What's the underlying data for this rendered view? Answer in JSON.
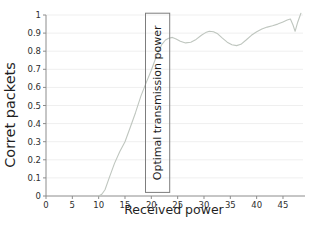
{
  "chart_data": {
    "type": "line",
    "title": "",
    "xlabel": "Received power",
    "ylabel": "Corret packets",
    "xlim": [
      0,
      48.8
    ],
    "ylim": [
      0,
      1
    ],
    "grid": "horizontal",
    "legend": "none",
    "xtick_values": [
      0,
      5,
      10,
      15,
      20,
      25,
      30,
      35,
      40,
      45
    ],
    "xtick_labels": [
      "0",
      "5",
      "10",
      "15",
      "20",
      "25",
      "30",
      "35",
      "40",
      "45"
    ],
    "ytick_values": [
      0,
      0.1,
      0.2,
      0.3,
      0.4,
      0.5,
      0.6,
      0.7,
      0.8,
      0.9,
      1
    ],
    "ytick_labels": [
      "0",
      "0.1",
      "0.2",
      "0.3",
      "0.4",
      "0.5",
      "0.6",
      "0.7",
      "0.8",
      "0.9",
      "1"
    ],
    "series": [
      {
        "name": "correct-packet-ratio",
        "x": [
          10,
          10.6,
          11.2,
          12,
          13,
          14,
          15,
          16,
          17,
          18,
          19,
          20,
          21,
          22,
          22.7,
          23.3,
          24,
          24.7,
          25.5,
          26.5,
          27.5,
          28.5,
          29.5,
          30.3,
          31,
          31.8,
          32.6,
          33.5,
          34.4,
          35.3,
          36.2,
          37,
          38,
          39,
          40,
          41,
          42,
          43,
          44,
          45,
          45.8,
          46.4,
          46.9,
          47.3,
          47.8,
          48.4
        ],
        "y": [
          0,
          0.01,
          0.035,
          0.1,
          0.18,
          0.245,
          0.3,
          0.38,
          0.46,
          0.55,
          0.625,
          0.695,
          0.775,
          0.838,
          0.862,
          0.872,
          0.876,
          0.868,
          0.855,
          0.846,
          0.85,
          0.865,
          0.888,
          0.903,
          0.91,
          0.908,
          0.896,
          0.872,
          0.85,
          0.836,
          0.831,
          0.838,
          0.862,
          0.888,
          0.908,
          0.922,
          0.933,
          0.941,
          0.95,
          0.962,
          0.972,
          0.978,
          0.945,
          0.91,
          0.96,
          1.01
        ]
      }
    ],
    "annotation": {
      "label": "Optimal transmission power",
      "x0": 18.9,
      "x1": 23.5,
      "y0": 0.02,
      "y1": 1.01
    }
  },
  "colors": {
    "background": "#ffffff",
    "line": "#bfc6bf",
    "grid": "#efefef",
    "axis": "#8c8c8c",
    "box_border": "#7d7d7d",
    "tick_text": "#2e2e2e",
    "label_text": "#1f1f1f"
  }
}
